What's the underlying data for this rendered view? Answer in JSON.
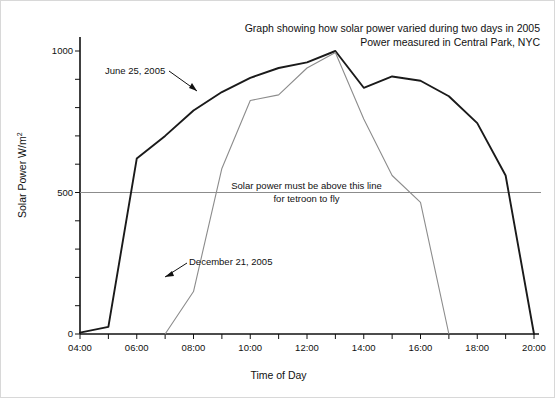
{
  "chart_data": {
    "type": "line",
    "title": "Graph showing how solar power varied during two days in 2005",
    "subtitle": "Power measured in Central Park, NYC",
    "xlabel": "Time of Day",
    "ylabel": "Solar Power W/m",
    "ylabel_exponent": "2",
    "xlim": [
      4,
      20
    ],
    "ylim": [
      0,
      1080
    ],
    "xticks": [
      4,
      5,
      6,
      7,
      8,
      9,
      10,
      11,
      12,
      13,
      14,
      15,
      16,
      17,
      18,
      19,
      20
    ],
    "xtick_labels": [
      "04:00",
      "",
      "06:00",
      "",
      "08:00",
      "",
      "10:00",
      "",
      "12:00",
      "",
      "14:00",
      "",
      "16:00",
      "",
      "18:00",
      "",
      "20:00"
    ],
    "yticks": [
      0,
      100,
      200,
      300,
      400,
      500,
      600,
      700,
      800,
      900,
      1000
    ],
    "ytick_labels": [
      "0",
      "",
      "",
      "",
      "",
      "500",
      "",
      "",
      "",
      "",
      "1000"
    ],
    "grid": false,
    "legend": "none",
    "threshold": {
      "value": 500,
      "color": "#8c8c8c",
      "label_line1": "Solar power must be above this line",
      "label_line2": "for tetroon to fly"
    },
    "series": [
      {
        "name": "June 25, 2005",
        "color": "#1a1a1a",
        "annotation": "June 25, 2005",
        "x": [
          4,
          5,
          6,
          7,
          8,
          9,
          10,
          11,
          12,
          13,
          14,
          15,
          16,
          17,
          18,
          19,
          20
        ],
        "values": [
          5,
          25,
          620,
          700,
          790,
          855,
          905,
          940,
          960,
          1000,
          870,
          910,
          895,
          840,
          745,
          560,
          0
        ]
      },
      {
        "name": "December 21, 2005",
        "color": "#8c8c8c",
        "annotation": "December 21, 2005",
        "x": [
          7,
          8,
          9,
          10,
          11,
          12,
          13,
          14,
          15,
          16,
          17
        ],
        "values": [
          0,
          150,
          585,
          825,
          845,
          940,
          995,
          760,
          560,
          465,
          0
        ]
      }
    ]
  },
  "axes": {
    "x_title": "Time of Day"
  }
}
